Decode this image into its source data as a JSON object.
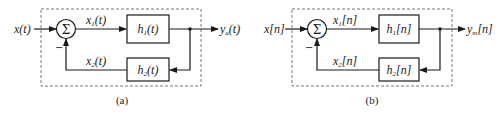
{
  "diagrams": [
    {
      "caption": "(a)",
      "input": "x(t)",
      "output_main": "y",
      "output_sub": "a",
      "output_arg": "(t)",
      "sum_symbol": "Σ",
      "minus_sign": "−",
      "forward_signal": {
        "main": "x",
        "sub": "1",
        "arg": "(t)"
      },
      "feedback_signal": {
        "main": "x",
        "sub": "2",
        "arg": "(t)"
      },
      "forward_block": {
        "main": "h",
        "sub": "1",
        "arg": "(t)"
      },
      "feedback_block": {
        "main": "h",
        "sub": "2",
        "arg": "(t)"
      }
    },
    {
      "caption": "(b)",
      "input": "x[n]",
      "output_main": "y",
      "output_sub": "m",
      "output_arg": "[n]",
      "sum_symbol": "Σ",
      "minus_sign": "−",
      "forward_signal": {
        "main": "x",
        "sub": "1",
        "arg": "[n]"
      },
      "feedback_signal": {
        "main": "x",
        "sub": "2",
        "arg": "[n]"
      },
      "forward_block": {
        "main": "h",
        "sub": "1",
        "arg": "[n]"
      },
      "feedback_block": {
        "main": "h",
        "sub": "2",
        "arg": "[n]"
      }
    }
  ]
}
